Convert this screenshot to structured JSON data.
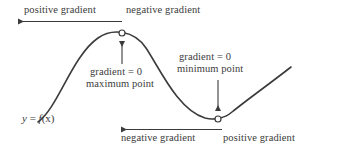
{
  "diagram": {
    "background_color": "#ffffff",
    "stroke_color": "#3b3b3b",
    "text_color": "#3b3b3b",
    "function_label": {
      "y": "y",
      "equals": " = ",
      "f": "f",
      "argument": "(x)",
      "full": "y = f(x)"
    },
    "labels": {
      "top_left": "positive gradient",
      "top_right": "negative gradient",
      "maximum_line1": "gradient = 0",
      "maximum_line2": "maximum point",
      "minimum_line1": "gradient = 0",
      "minimum_line2": "minimum point",
      "bottom_left": "negative gradient",
      "bottom_right": "positive gradient"
    },
    "points": [
      {
        "name": "maximum-point",
        "x": 122,
        "y": 33,
        "marker": "open-circle"
      },
      {
        "name": "minimum-point",
        "x": 218,
        "y": 119,
        "marker": "open-circle"
      }
    ],
    "arrows": [
      {
        "name": "top-gradient-arrow",
        "from_x": 122,
        "from_y": 21,
        "to_x": 13,
        "to_y": 21,
        "direction": "left"
      },
      {
        "name": "maximum-pointer-arrow",
        "from_x": 122,
        "from_y": 64,
        "to_x": 122,
        "to_y": 37,
        "direction": "up"
      },
      {
        "name": "minimum-pointer-arrow",
        "from_x": 218,
        "from_y": 80,
        "to_x": 218,
        "to_y": 115,
        "direction": "down"
      },
      {
        "name": "bottom-gradient-arrow",
        "from_x": 222,
        "from_y": 129,
        "to_x": 116,
        "to_y": 129,
        "direction": "left"
      }
    ],
    "curve": {
      "name": "sinusoidal-curve",
      "path": "M 38,122 C 58,108 72,56 98,38 C 112,28 134,30 146,48 C 160,69 178,110 205,118 C 213,120 224,119 232,112 C 248,99 272,82 291,67",
      "stroke_width": 1.6
    }
  }
}
